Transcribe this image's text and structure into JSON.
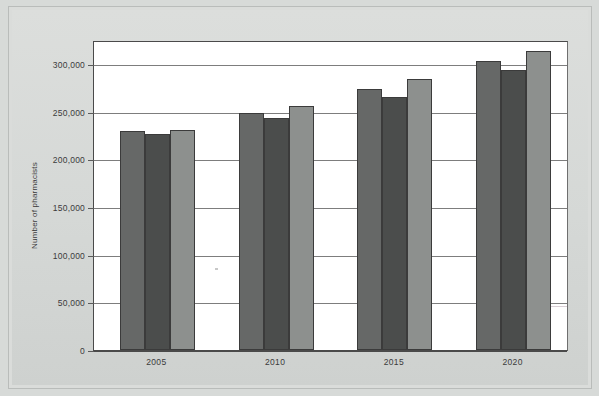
{
  "chart_data": {
    "type": "bar",
    "title": "",
    "xlabel": "",
    "ylabel": "Number of pharmacists",
    "categories": [
      "2005",
      "2010",
      "2015",
      "2020"
    ],
    "series": [
      {
        "name": "series-1",
        "color": "#666867",
        "values": [
          230000,
          249000,
          274000,
          303000
        ]
      },
      {
        "name": "series-2",
        "color": "#4b4d4c",
        "values": [
          226000,
          243000,
          265000,
          294000
        ]
      },
      {
        "name": "series-3",
        "color": "#8d908e",
        "values": [
          231000,
          256000,
          284000,
          314000
        ]
      }
    ],
    "ylim": [
      0,
      325000
    ],
    "yticks": [
      0,
      50000,
      100000,
      150000,
      200000,
      250000,
      300000
    ],
    "ytick_labels": [
      "0",
      "50,000",
      "100,000",
      "150,000",
      "200,000",
      "250,000",
      "300,000"
    ],
    "grid": true,
    "legend": "none"
  },
  "axes": {
    "y_title": "Number of pharmacists"
  }
}
